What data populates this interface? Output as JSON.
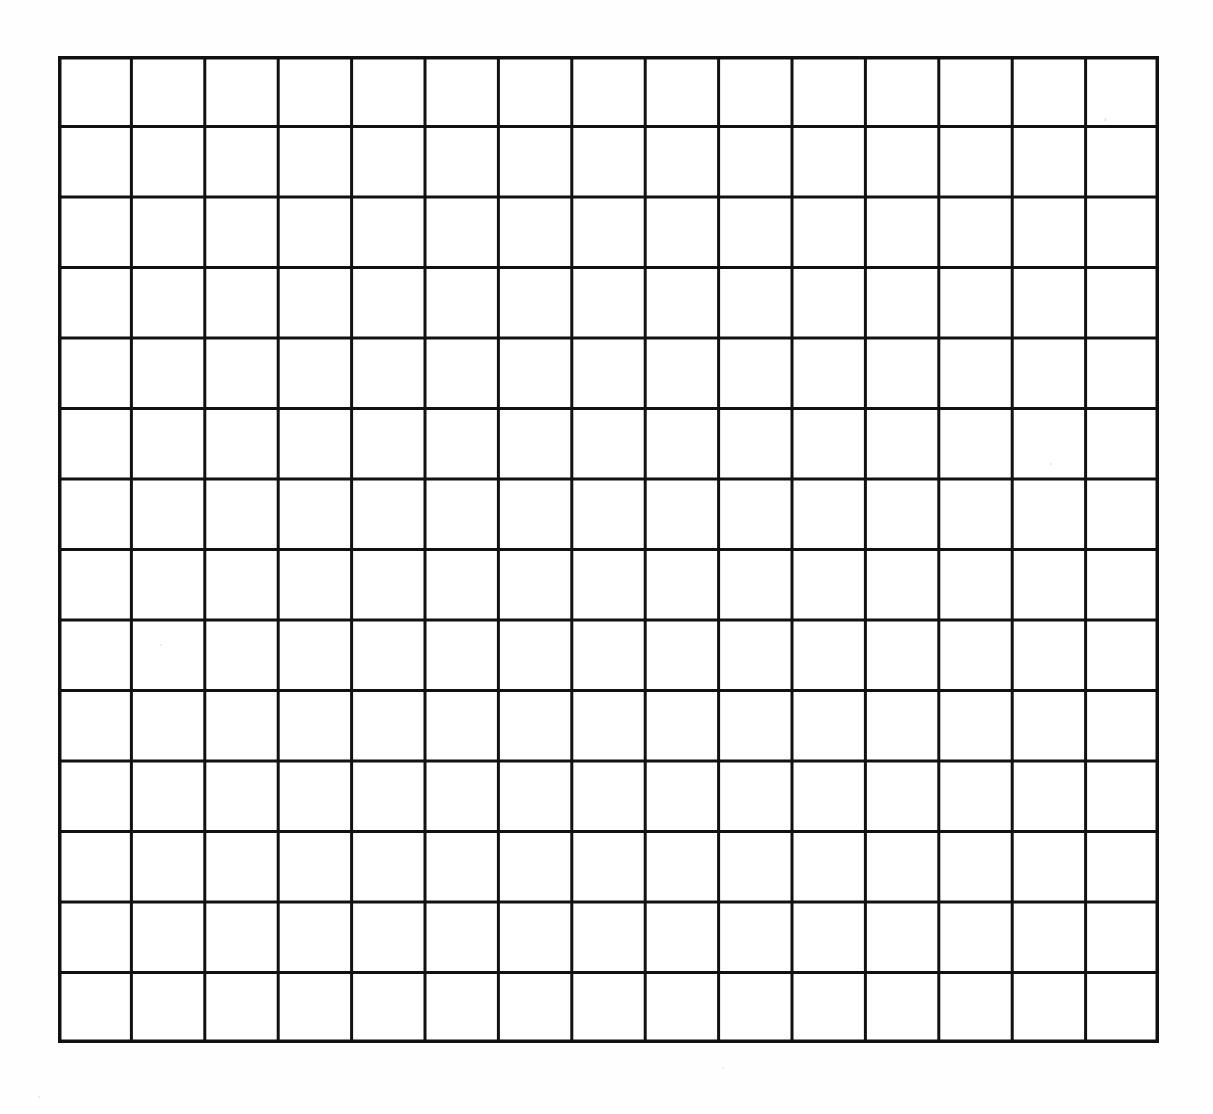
{
  "document": {
    "kind": "blank-grid-worksheet",
    "title": "Blank Grid Sheet",
    "background_color": "#ffffff",
    "sheet_color": "#fefefe",
    "line_color": "#111111"
  },
  "grid": {
    "columns": 15,
    "rows": 14,
    "total_cells": 210,
    "left_px": 58,
    "top_px": 56,
    "width_px": 1101,
    "height_px": 987,
    "cell_width_px": 73.4,
    "cell_height_px": 70.5,
    "interior_line_width_px": 3,
    "border_line_width_px": 3.5,
    "cell_fill": "#ffffff",
    "cell_text": ""
  },
  "artifacts": [
    {
      "name": "scan-speck-top-right",
      "x_px": 1104,
      "y_px": 118,
      "size_px": 3
    },
    {
      "name": "scan-speck-mid-right",
      "x_px": 1050,
      "y_px": 463,
      "size_px": 2
    },
    {
      "name": "scan-speck-left",
      "x_px": 160,
      "y_px": 644,
      "size_px": 2
    },
    {
      "name": "scan-speck-bottom-left",
      "x_px": 38,
      "y_px": 1096,
      "size_px": 2
    },
    {
      "name": "scan-speck-bottom-mid",
      "x_px": 722,
      "y_px": 1067,
      "size_px": 2
    }
  ]
}
